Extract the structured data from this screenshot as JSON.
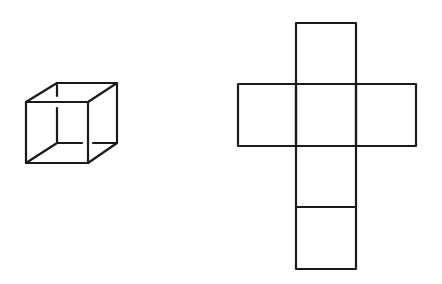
{
  "diagram": {
    "stroke_color": "#1a1a1a",
    "background": "#ffffff",
    "cube": {
      "label": "wireframe cube",
      "front_face": [
        [
          26,
          102
        ],
        [
          88,
          102
        ],
        [
          88,
          163
        ],
        [
          26,
          163
        ]
      ],
      "back_face": [
        [
          57,
          83
        ],
        [
          117,
          83
        ],
        [
          117,
          143
        ],
        [
          57,
          143
        ]
      ],
      "hidden_edges": "dashed/broken"
    },
    "net": {
      "label": "cube net (cross)",
      "squares": [
        {
          "name": "top",
          "x": 296,
          "y": 23,
          "w": 60,
          "h": 61
        },
        {
          "name": "left",
          "x": 238,
          "y": 84,
          "w": 58,
          "h": 62
        },
        {
          "name": "center",
          "x": 296,
          "y": 84,
          "w": 60,
          "h": 62
        },
        {
          "name": "right",
          "x": 356,
          "y": 84,
          "w": 60,
          "h": 62
        },
        {
          "name": "lower",
          "x": 296,
          "y": 146,
          "w": 60,
          "h": 61
        },
        {
          "name": "bottom",
          "x": 296,
          "y": 207,
          "w": 60,
          "h": 62
        }
      ]
    }
  }
}
